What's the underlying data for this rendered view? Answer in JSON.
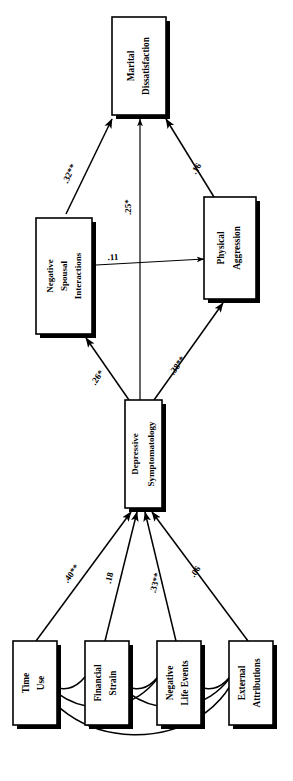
{
  "diagram": {
    "type": "path-model",
    "title": "",
    "orientation": "rotated-90",
    "background_color": "#ffffff",
    "line_color": "#000000",
    "box_fill": "#ffffff",
    "boxes": [
      {
        "id": "marital_dissatisfaction",
        "label_line1": "Marital",
        "label_line2": "Dissatisfaction",
        "role": "endogenous-outcome"
      },
      {
        "id": "physical_aggression",
        "label_line1": "Physical",
        "label_line2": "Aggression",
        "role": "endogenous-mediator"
      },
      {
        "id": "negative_spousal_interactions",
        "label_line1": "Negative",
        "label_line2": "Spousal",
        "label_line3": "Interactions",
        "role": "endogenous-mediator"
      },
      {
        "id": "depressive_symptomatology",
        "label_line1": "Depressive",
        "label_line2": "Symptomatology",
        "role": "endogenous-mediator"
      },
      {
        "id": "time_use",
        "label_line1": "Time",
        "label_line2": "Use",
        "role": "exogenous"
      },
      {
        "id": "financial_strain",
        "label_line1": "Financial",
        "label_line2": "Strain",
        "role": "exogenous"
      },
      {
        "id": "negative_life_events",
        "label_line1": "Negative",
        "label_line2": "Life Events",
        "role": "exogenous"
      },
      {
        "id": "external_attributions",
        "label_line1": "External",
        "label_line2": "Attributions",
        "role": "exogenous"
      }
    ],
    "paths": [
      {
        "id": "nsi_to_md",
        "from": "negative_spousal_interactions",
        "to": "marital_dissatisfaction",
        "coefficient": ".32**",
        "significance": "p<.01"
      },
      {
        "id": "ds_to_md",
        "from": "depressive_symptomatology",
        "to": "marital_dissatisfaction",
        "coefficient": ".25*",
        "significance": "p<.05"
      },
      {
        "id": "pa_to_md",
        "from": "physical_aggression",
        "to": "marital_dissatisfaction",
        "coefficient": ".16",
        "significance": "ns"
      },
      {
        "id": "nsi_to_pa",
        "from": "negative_spousal_interactions",
        "to": "physical_aggression",
        "coefficient": ".11",
        "significance": "ns"
      },
      {
        "id": "ds_to_nsi",
        "from": "depressive_symptomatology",
        "to": "negative_spousal_interactions",
        "coefficient": ".26*",
        "significance": "p<.05"
      },
      {
        "id": "ds_to_pa",
        "from": "depressive_symptomatology",
        "to": "physical_aggression",
        "coefficient": ".38**",
        "significance": "p<.01"
      },
      {
        "id": "tu_to_ds",
        "from": "time_use",
        "to": "depressive_symptomatology",
        "coefficient": ".40**",
        "significance": "p<.01"
      },
      {
        "id": "fs_to_ds",
        "from": "financial_strain",
        "to": "depressive_symptomatology",
        "coefficient": ".18",
        "significance": "ns"
      },
      {
        "id": "nle_to_ds",
        "from": "negative_life_events",
        "to": "depressive_symptomatology",
        "coefficient": ".33**",
        "significance": "p<.01"
      },
      {
        "id": "ea_to_ds",
        "from": "external_attributions",
        "to": "depressive_symptomatology",
        "coefficient": ".06",
        "significance": "ns"
      }
    ],
    "correlations": [
      {
        "id": "corr_tu_fs",
        "between": [
          "time_use",
          "financial_strain"
        ],
        "coefficient": ""
      },
      {
        "id": "corr_fs_nle",
        "between": [
          "financial_strain",
          "negative_life_events"
        ],
        "coefficient": ""
      },
      {
        "id": "corr_nle_ea",
        "between": [
          "negative_life_events",
          "external_attributions"
        ],
        "coefficient": ""
      },
      {
        "id": "corr_tu_nle",
        "between": [
          "time_use",
          "negative_life_events"
        ],
        "coefficient": ""
      },
      {
        "id": "corr_fs_ea",
        "between": [
          "financial_strain",
          "external_attributions"
        ],
        "coefficient": ""
      },
      {
        "id": "corr_tu_ea",
        "between": [
          "time_use",
          "external_attributions"
        ],
        "coefficient": ""
      }
    ]
  }
}
